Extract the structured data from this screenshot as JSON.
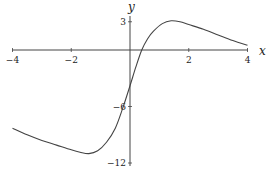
{
  "chart_data": {
    "type": "line",
    "title": "",
    "xlabel": "x",
    "ylabel": "y",
    "xlim": [
      -4,
      4
    ],
    "ylim": [
      -12,
      3
    ],
    "grid": false,
    "legend": null,
    "x_ticks": [
      -4,
      -2,
      2,
      4
    ],
    "y_ticks": [
      3,
      -6,
      -12
    ],
    "x_tick_labels": [
      "−4",
      "−2",
      "2",
      "4"
    ],
    "y_tick_labels": [
      "3",
      "−6",
      "−12"
    ],
    "series": [
      {
        "name": "curve",
        "x": [
          -4,
          -3.5,
          -3,
          -2.5,
          -2,
          -1.7,
          -1.4,
          -1.1,
          -0.8,
          -0.5,
          -0.25,
          0,
          0.2,
          0.4,
          0.6,
          0.8,
          1.1,
          1.4,
          1.7,
          2,
          2.5,
          3,
          3.5,
          4
        ],
        "values": [
          -8.3,
          -9.0,
          -9.6,
          -10.1,
          -10.6,
          -10.85,
          -11.0,
          -10.7,
          -9.8,
          -8.3,
          -6.2,
          -3.8,
          -1.8,
          0.0,
          1.2,
          2.0,
          2.8,
          3.1,
          3.0,
          2.7,
          2.2,
          1.6,
          1.0,
          0.5
        ]
      }
    ],
    "line_color": "#444444"
  }
}
